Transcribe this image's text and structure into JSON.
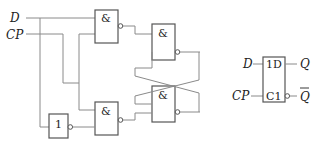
{
  "circuit": {
    "inputs": [
      {
        "label": "D"
      },
      {
        "label": "CP"
      }
    ],
    "gates": [
      {
        "id": "g1",
        "type": "NAND",
        "symbol": "&"
      },
      {
        "id": "g2",
        "type": "NAND",
        "symbol": "&"
      },
      {
        "id": "g3",
        "type": "NAND",
        "symbol": "&"
      },
      {
        "id": "g4",
        "type": "NAND",
        "symbol": "&"
      },
      {
        "id": "inv",
        "type": "NOT",
        "symbol": "1"
      }
    ]
  },
  "symbol": {
    "input_d": "D",
    "input_cp": "CP",
    "pin_1d": "1D",
    "pin_c1": "C1",
    "output_q": "Q",
    "output_qbar": "Q"
  },
  "colors": {
    "wire": "#8a8a8a",
    "gate_stroke": "#555555",
    "text": "#222222"
  }
}
